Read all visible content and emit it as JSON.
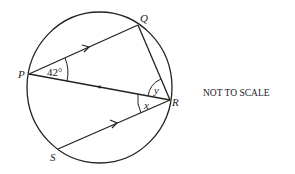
{
  "diagram": {
    "points": {
      "P": {
        "label": "P"
      },
      "Q": {
        "label": "Q"
      },
      "R": {
        "label": "R"
      },
      "S": {
        "label": "S"
      }
    },
    "angles": {
      "QPR": "42°",
      "QRP": "y",
      "PRS": "x"
    },
    "note": "NOT TO SCALE",
    "parallel_lines": [
      "PQ",
      "SR"
    ],
    "diameter": "PR"
  }
}
